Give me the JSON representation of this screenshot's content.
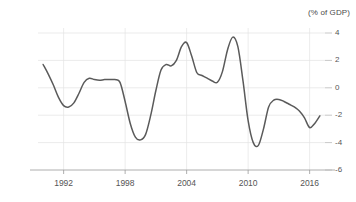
{
  "chart_data": {
    "type": "line",
    "title": "(% of GDP)",
    "xlabel": "",
    "ylabel": "",
    "xlim": [
      1989.5,
      2017.5
    ],
    "ylim": [
      -6,
      4
    ],
    "grid": true,
    "legend": "none",
    "y_ticks": [
      4,
      2,
      0,
      -2,
      -4,
      -6
    ],
    "y_tick_labels": [
      "4",
      "2",
      "0",
      "-2",
      "-4",
      "-6"
    ],
    "x_ticks": [
      1992,
      1998,
      2004,
      2010,
      2016
    ],
    "x_tick_labels": [
      "1992",
      "1998",
      "2004",
      "2010",
      "2016"
    ],
    "line_color": "#5a5a5a",
    "grid_color": "#e2e2e2",
    "series": [
      {
        "name": "Balance",
        "x": [
          1990.0,
          1990.5,
          1991.0,
          1991.5,
          1992.0,
          1992.5,
          1993.0,
          1993.5,
          1994.0,
          1994.5,
          1995.0,
          1995.5,
          1996.0,
          1996.5,
          1997.0,
          1997.5,
          1998.0,
          1998.5,
          1999.0,
          1999.5,
          2000.0,
          2000.5,
          2001.0,
          2001.5,
          2002.0,
          2002.5,
          2003.0,
          2003.5,
          2004.0,
          2004.5,
          2005.0,
          2005.5,
          2006.0,
          2006.5,
          2007.0,
          2007.5,
          2008.0,
          2008.5,
          2009.0,
          2009.5,
          2010.0,
          2010.5,
          2011.0,
          2011.5,
          2012.0,
          2012.5,
          2013.0,
          2013.5,
          2014.0,
          2014.5,
          2015.0,
          2015.5,
          2016.0,
          2016.5,
          2017.0
        ],
        "y": [
          1.7,
          1.0,
          0.2,
          -0.7,
          -1.3,
          -1.4,
          -1.1,
          -0.4,
          0.4,
          0.7,
          0.6,
          0.55,
          0.6,
          0.6,
          0.6,
          0.4,
          -1.0,
          -2.6,
          -3.6,
          -3.8,
          -3.4,
          -2.0,
          -0.2,
          1.3,
          1.7,
          1.6,
          2.0,
          3.0,
          3.3,
          2.3,
          1.1,
          0.9,
          0.7,
          0.5,
          0.4,
          1.2,
          2.8,
          3.7,
          3.0,
          0.5,
          -2.4,
          -4.0,
          -4.2,
          -3.0,
          -1.4,
          -0.9,
          -0.85,
          -1.0,
          -1.2,
          -1.4,
          -1.7,
          -2.2,
          -2.9,
          -2.6,
          -2.05
        ]
      }
    ]
  }
}
